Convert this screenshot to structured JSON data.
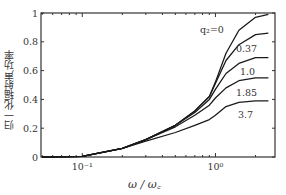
{
  "chart_data": {
    "type": "line",
    "title": "",
    "xlabel": "ω / ω_c",
    "ylabel": "归一化辐射声功率",
    "xscale": "log",
    "xlim": [
      0.049,
      2.8
    ],
    "ylim": [
      0,
      1
    ],
    "x_ticks": [
      {
        "value": 0.1,
        "label": "10⁻¹"
      },
      {
        "value": 1,
        "label": "10⁰"
      }
    ],
    "y_ticks": [
      {
        "value": 0,
        "label": "0"
      },
      {
        "value": 0.2,
        "label": "0.2"
      },
      {
        "value": 0.4,
        "label": "0.4"
      },
      {
        "value": 0.6,
        "label": "0.6"
      },
      {
        "value": 0.8,
        "label": "0.8"
      },
      {
        "value": 1,
        "label": "1"
      }
    ],
    "grid": false,
    "legend_position": "inline annotations at right",
    "x": [
      0.05,
      0.1,
      0.2,
      0.3,
      0.5,
      0.7,
      0.9,
      1.0,
      1.2,
      1.5,
      2.0,
      2.5
    ],
    "series": [
      {
        "name": "q₂=0",
        "label": "q₂=0",
        "values": [
          0.0,
          0.005,
          0.06,
          0.12,
          0.22,
          0.32,
          0.42,
          0.52,
          0.72,
          0.88,
          0.97,
          0.99
        ]
      },
      {
        "name": "q₂=0.37",
        "label": "0.37",
        "values": [
          0.0,
          0.005,
          0.06,
          0.12,
          0.22,
          0.32,
          0.42,
          0.51,
          0.67,
          0.78,
          0.85,
          0.86
        ]
      },
      {
        "name": "q₂=1.0",
        "label": "1.0",
        "values": [
          0.0,
          0.005,
          0.06,
          0.12,
          0.22,
          0.31,
          0.4,
          0.47,
          0.58,
          0.65,
          0.69,
          0.69
        ]
      },
      {
        "name": "q₂=1.85",
        "label": "1.85",
        "values": [
          0.0,
          0.005,
          0.06,
          0.12,
          0.21,
          0.29,
          0.36,
          0.41,
          0.48,
          0.53,
          0.55,
          0.55
        ]
      },
      {
        "name": "q₂=3.7",
        "label": "3.7",
        "values": [
          0.0,
          0.005,
          0.06,
          0.11,
          0.17,
          0.22,
          0.26,
          0.29,
          0.35,
          0.38,
          0.39,
          0.39
        ]
      }
    ]
  },
  "labels": {
    "ylabel": "归一化辐射声功率",
    "xlabel": "ω / ω꜀"
  },
  "style": {
    "line_color": "#1a1a1a",
    "axis_color": "#333333"
  }
}
